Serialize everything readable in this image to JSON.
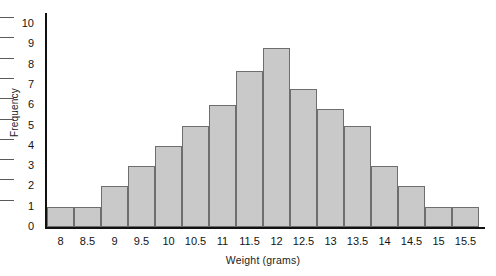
{
  "chart_data": {
    "type": "bar",
    "title": "",
    "xlabel": "Weight (grams)",
    "ylabel": "Frequency",
    "categories": [
      "8",
      "8.5",
      "9",
      "9.5",
      "10",
      "10.5",
      "11",
      "11.5",
      "12",
      "12.5",
      "13",
      "13.5",
      "14",
      "14.5",
      "15",
      "15.5"
    ],
    "values": [
      1,
      1,
      2,
      3,
      4,
      5,
      6,
      7.7,
      8.8,
      6.8,
      5.8,
      5,
      3,
      2,
      1,
      1
    ],
    "ylim": [
      0,
      10
    ],
    "yticks": [
      0,
      1,
      2,
      3,
      4,
      5,
      6,
      7,
      8,
      9,
      10
    ],
    "ytick_labels": [
      "0",
      "1",
      "2",
      "3",
      "4",
      "5",
      "6",
      "7",
      "8",
      "9",
      "10"
    ],
    "grid": false,
    "legend": "none",
    "bar_color": "#c9c9c9",
    "bar_border_color": "#6e6e6e",
    "axis_color": "#111111",
    "background": "#ffffff"
  },
  "axes": {
    "y_title": "Frequency",
    "x_title": "Weight (grams)"
  }
}
